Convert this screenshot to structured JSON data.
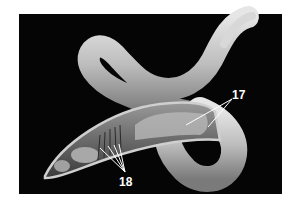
{
  "figure": {
    "background_color": "#050505",
    "labels": [
      {
        "text": "17",
        "x": 232,
        "y": 88
      },
      {
        "text": "18",
        "x": 119,
        "y": 176
      }
    ]
  }
}
